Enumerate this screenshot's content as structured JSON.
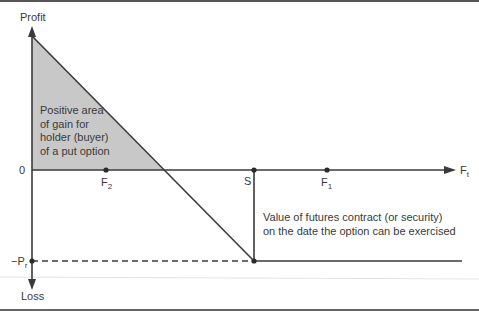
{
  "diagram": {
    "axis_labels": {
      "y_top": "Profit",
      "y_bottom": "Loss",
      "x_right_main": "F",
      "x_right_sub": "t",
      "zero": "0",
      "premium_main": "−P",
      "premium_sub": "r"
    },
    "points": {
      "f2_main": "F",
      "f2_sub": "2",
      "s": "S",
      "f1_main": "F",
      "f1_sub": "1"
    },
    "annotations": {
      "gain_line1": "Positive area",
      "gain_line2": "of gain for",
      "gain_line3": "holder (buyer)",
      "gain_line4": "of a put option",
      "value_line1": "Value of futures contract (or security)",
      "value_line2": "on the date the option can be exercised"
    },
    "colors": {
      "line": "#3a3a3a",
      "shade": "#c8c8c8",
      "border": "#555555",
      "faint": "#dddddd"
    }
  }
}
